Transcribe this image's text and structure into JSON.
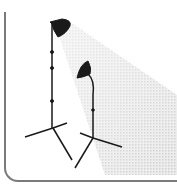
{
  "illustration": {
    "subject": "studio-lights",
    "elements": [
      "light-beam",
      "tall-lamp-stand",
      "short-lamp-stand",
      "frame"
    ],
    "colors": {
      "frame": "#7a7a7a",
      "lamp": "#1a1a1a",
      "beam": "#d9d9d9"
    }
  }
}
